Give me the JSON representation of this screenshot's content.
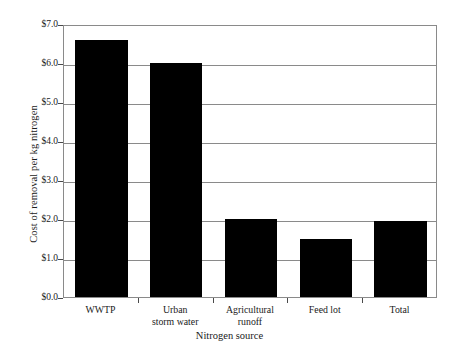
{
  "chart_data": {
    "type": "bar",
    "title": "",
    "xlabel": "Nitrogen source",
    "ylabel": "Cost of removal per kg nitrogen",
    "categories": [
      "WWTP",
      "Urban\nstorm water",
      "Agricultural\nrunoff",
      "Feed lot",
      "Total"
    ],
    "values": [
      6.6,
      6.0,
      2.0,
      1.5,
      1.95
    ],
    "ylim": [
      0.0,
      7.0
    ],
    "ytick_values": [
      0.0,
      1.0,
      2.0,
      3.0,
      4.0,
      5.0,
      6.0,
      7.0
    ],
    "ytick_labels": [
      "$0.0",
      "$1.0",
      "$2.0",
      "$3.0",
      "$4.0",
      "$5.0",
      "$6.0",
      "$7.0"
    ],
    "grid": true,
    "grid_axis": "y",
    "legend": false,
    "bar_color": "#000000",
    "grid_color": "#8a8a8a",
    "frame_color": "#8a8a8a",
    "background_color": "#ffffff"
  }
}
